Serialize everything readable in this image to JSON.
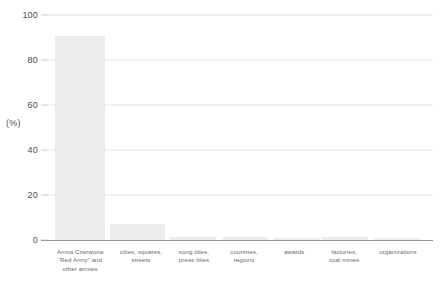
{
  "chart_data": {
    "type": "bar",
    "title": "",
    "subtitle": "",
    "xlabel": "",
    "ylabel": "(%)",
    "ylim": [
      0,
      100
    ],
    "grid": true,
    "legend": null,
    "legend_position": "none",
    "yticks": [
      0,
      20,
      40,
      60,
      80,
      100
    ],
    "ytick_labels": [
      "0",
      "20",
      "40",
      "60",
      "80",
      "100"
    ],
    "categories": [
      "Armia Czerwona\n“Red Army” and\nother armies",
      "cities, squares,\nstreets",
      "song titles,\npress titles",
      "countries,\nregions",
      "awards",
      "factories,\ncoal mines",
      "organizations"
    ],
    "category_lines": [
      [
        "Armia Czerwona",
        "“Red Army” and",
        "other armies"
      ],
      [
        "cities, squares,",
        "streets"
      ],
      [
        "song titles,",
        "press titles"
      ],
      [
        "countries,",
        "regions"
      ],
      [
        "awards"
      ],
      [
        "factories,",
        "coal mines"
      ],
      [
        "organizations"
      ]
    ],
    "values": [
      90.5,
      7.0,
      1.5,
      1.2,
      1.0,
      1.2,
      0.8
    ],
    "bar_color": "#ececec",
    "gridline_color": "#e4e4e4",
    "axis_color": "#9a9a9a",
    "tick_label_color": "#4d4d4d",
    "category_label_color": "#6b6b6b",
    "background_color": "#ffffff"
  },
  "geometry": {
    "plot_left": 48,
    "plot_right": 433,
    "y_top_px": 15,
    "y_bottom_px": 240,
    "label_top_px": 248,
    "bars": [
      {
        "x": 55,
        "w": 50
      },
      {
        "x": 110,
        "w": 55
      },
      {
        "x": 170,
        "w": 46
      },
      {
        "x": 222,
        "w": 46
      },
      {
        "x": 274,
        "w": 46
      },
      {
        "x": 322,
        "w": 46
      },
      {
        "x": 373,
        "w": 47
      }
    ],
    "label_boxes": [
      {
        "x": 38,
        "w": 84
      },
      {
        "x": 110,
        "w": 62
      },
      {
        "x": 166,
        "w": 56
      },
      {
        "x": 216,
        "w": 56
      },
      {
        "x": 266,
        "w": 56
      },
      {
        "x": 316,
        "w": 56
      },
      {
        "x": 366,
        "w": 64
      }
    ]
  }
}
